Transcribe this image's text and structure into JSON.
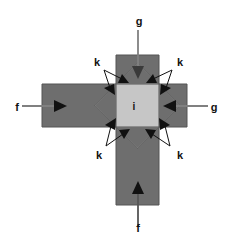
{
  "figure": {
    "type": "force-interaction-diagram",
    "background_color": "#ffffff",
    "shape": "cross"
  },
  "colors": {
    "arm_fill": "#6e6e6e",
    "center_fill": "#c6c6c6",
    "outline": "#555555",
    "arrow_dark": "#111111",
    "arrow_gray": "#808080",
    "label_color": "#111111"
  },
  "geometry": {
    "arm_thickness_px": 43,
    "horizontal_arm": {
      "x": 42,
      "y": 84,
      "width": 145,
      "height": 43
    },
    "vertical_arm": {
      "x": 116,
      "y": 55,
      "width": 43,
      "height": 150
    },
    "center_square": {
      "x": 116,
      "y": 84,
      "width": 43,
      "height": 43
    },
    "notch_depth_px": 21
  },
  "labels": {
    "center": {
      "text": "i",
      "x": 134,
      "y": 109,
      "meaning": "central-element"
    },
    "top": {
      "text": "g",
      "x": 139,
      "y": 24,
      "meaning": "external-load-top"
    },
    "right": {
      "text": "g",
      "x": 213,
      "y": 110,
      "meaning": "external-load-right"
    },
    "left": {
      "text": "f",
      "x": 16,
      "y": 110,
      "meaning": "external-load-left"
    },
    "bottom": {
      "text": "f",
      "x": 136,
      "y": 231,
      "meaning": "external-load-bottom"
    },
    "k_top_left": {
      "text": "k",
      "x": 94,
      "y": 66,
      "meaning": "interaction-force"
    },
    "k_top_right": {
      "text": "k",
      "x": 177,
      "y": 66,
      "meaning": "interaction-force"
    },
    "k_bottom_left": {
      "text": "k",
      "x": 95,
      "y": 158,
      "meaning": "interaction-force"
    },
    "k_bottom_right": {
      "text": "k",
      "x": 177,
      "y": 158,
      "meaning": "interaction-force"
    }
  },
  "load_arrows": [
    {
      "name": "arrow-g-top",
      "from": [
        138,
        30
      ],
      "to": [
        138,
        75
      ],
      "direction": "down",
      "color": "#808080",
      "label": "g"
    },
    {
      "name": "arrow-g-right",
      "from": [
        208,
        106
      ],
      "to": [
        164,
        106
      ],
      "direction": "left",
      "color": "#808080",
      "label": "g"
    },
    {
      "name": "arrow-f-left",
      "from": [
        22,
        106
      ],
      "to": [
        64,
        106
      ],
      "direction": "right",
      "color": "#808080",
      "label": "f"
    },
    {
      "name": "arrow-f-bottom",
      "from": [
        138,
        226
      ],
      "to": [
        138,
        182
      ],
      "direction": "up",
      "color": "#111111",
      "label": "f"
    }
  ],
  "k_arrow_groups": [
    {
      "name": "k-group-top-left",
      "label": "k",
      "origin": [
        104,
        69
      ],
      "targets": [
        [
          126,
          82
        ],
        [
          114,
          92
        ]
      ]
    },
    {
      "name": "k-group-top-right",
      "label": "k",
      "origin": [
        172,
        69
      ],
      "targets": [
        [
          149,
          82
        ],
        [
          161,
          92
        ]
      ]
    },
    {
      "name": "k-group-bottom-left",
      "label": "k",
      "origin": [
        106,
        147
      ],
      "targets": [
        [
          126,
          129
        ],
        [
          114,
          119
        ]
      ]
    },
    {
      "name": "k-group-bottom-right",
      "label": "k",
      "origin": [
        170,
        147
      ],
      "targets": [
        [
          149,
          129
        ],
        [
          161,
          119
        ]
      ]
    }
  ]
}
